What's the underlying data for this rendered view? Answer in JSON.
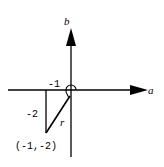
{
  "diagram": {
    "type": "complex-plane-polar",
    "axes": {
      "horizontal_label": "a",
      "vertical_label": "b"
    },
    "point": {
      "label": "(-1,-2)",
      "a": -1,
      "b": -2
    },
    "annotations": {
      "horizontal_leg": "-1",
      "vertical_leg": "-2",
      "radius": "r"
    },
    "angle_marker": "arc around origin (angle measured from positive a-axis)"
  }
}
